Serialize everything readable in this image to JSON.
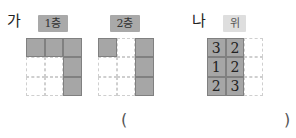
{
  "problem": {
    "ga": {
      "label": "가",
      "floors": [
        {
          "label": "1층",
          "cells": [
            [
              1,
              1,
              1
            ],
            [
              0,
              0,
              1
            ],
            [
              0,
              0,
              1
            ]
          ]
        },
        {
          "label": "2층",
          "cells": [
            [
              1,
              0,
              1
            ],
            [
              0,
              0,
              1
            ],
            [
              0,
              0,
              1
            ]
          ]
        }
      ]
    },
    "na": {
      "label": "나",
      "view_label": "위",
      "cells": [
        [
          "3",
          "2",
          ""
        ],
        [
          "1",
          "2",
          ""
        ],
        [
          "2",
          "3",
          ""
        ]
      ]
    },
    "answer": {
      "open": "(",
      "close": ")",
      "value": ""
    }
  }
}
